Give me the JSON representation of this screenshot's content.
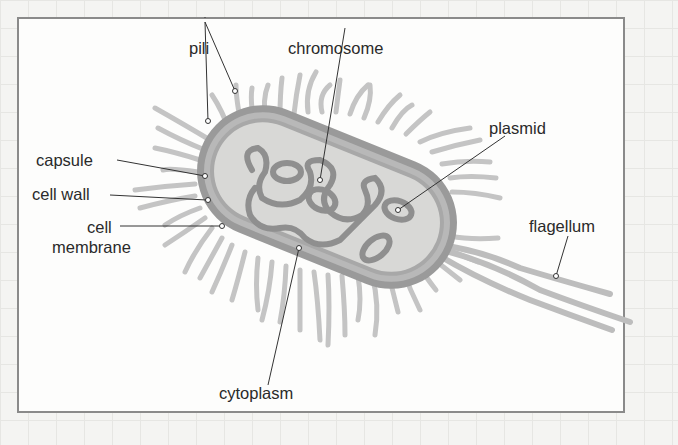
{
  "diagram": {
    "colors": {
      "background": "#fdfdfc",
      "frame": "#8a8a8a",
      "capsule": "#9a9a9a",
      "cell_wall": "#b8b8b8",
      "cytoplasm": "#d8d8d6",
      "dna": "#8f8f8f",
      "pili": "#c4c4c4",
      "label_text": "#2a2a2a"
    },
    "labels": {
      "pili": "pili",
      "chromosome": "chromosome",
      "plasmid": "plasmid",
      "capsule": "capsule",
      "cell_wall": "cell wall",
      "cell_membrane_line1": "cell",
      "cell_membrane_line2": "membrane",
      "flagellum": "flagellum",
      "cytoplasm": "cytoplasm"
    }
  }
}
